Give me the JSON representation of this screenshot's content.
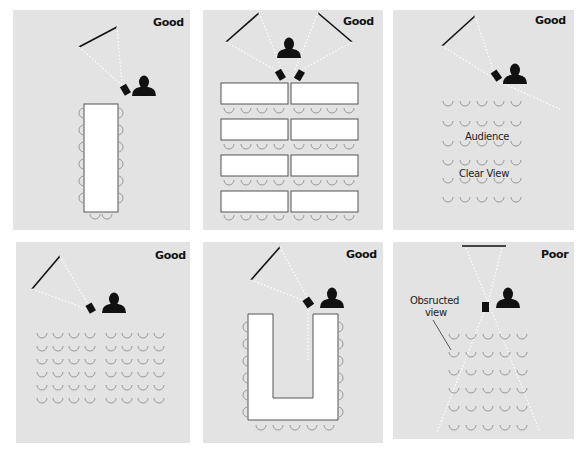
{
  "colors": {
    "panel_bg": "#e3e3e3",
    "ink": "#111111",
    "chair": "#9a9a9a",
    "table": "#ffffff",
    "beam": "#ffffff"
  },
  "panels": [
    {
      "id": "boardroom",
      "rating": "Good",
      "layout": "single long table, chairs on both sides, 2 at end"
    },
    {
      "id": "classroom",
      "rating": "Good",
      "layout": "4 rows of paired tables, dual screens"
    },
    {
      "id": "theater-angled",
      "rating": "Good",
      "layout": "5x6 chair rows, angled screen",
      "notes": [
        "Audience",
        "Clear View"
      ]
    },
    {
      "id": "theater-wide",
      "rating": "Good",
      "layout": "8x6 chair rows, angled screen"
    },
    {
      "id": "u-shape",
      "rating": "Good",
      "layout": "U-shaped table, chairs around outside"
    },
    {
      "id": "theater-center",
      "rating": "Poor",
      "layout": "center projector blocking view",
      "notes": [
        "Obsructed",
        "view"
      ]
    }
  ]
}
